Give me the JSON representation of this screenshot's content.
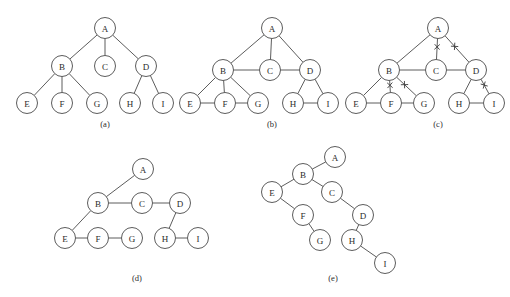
{
  "figure": {
    "title": "",
    "colors": {
      "stroke": "#4a4a4a",
      "node_fill": "#ffffff",
      "label": "#2b2b2b",
      "background": "#ffffff",
      "xmark": "#3a3a3a"
    },
    "node_radius": 10.5,
    "panels": [
      {
        "id": "a",
        "caption": "(a)",
        "caption_pos": {
          "x": 105,
          "y": 127
        },
        "nodes": [
          {
            "label": "A",
            "x": 105,
            "y": 28
          },
          {
            "label": "B",
            "x": 62,
            "y": 66
          },
          {
            "label": "C",
            "x": 105,
            "y": 66
          },
          {
            "label": "D",
            "x": 146,
            "y": 66
          },
          {
            "label": "E",
            "x": 27,
            "y": 103
          },
          {
            "label": "F",
            "x": 62,
            "y": 103
          },
          {
            "label": "G",
            "x": 97,
            "y": 103
          },
          {
            "label": "H",
            "x": 130,
            "y": 103
          },
          {
            "label": "I",
            "x": 163,
            "y": 103
          }
        ],
        "edges": [
          {
            "from": "A",
            "to": "B",
            "marked": false
          },
          {
            "from": "A",
            "to": "C",
            "marked": false
          },
          {
            "from": "A",
            "to": "D",
            "marked": false
          },
          {
            "from": "B",
            "to": "E",
            "marked": false
          },
          {
            "from": "B",
            "to": "F",
            "marked": false
          },
          {
            "from": "B",
            "to": "G",
            "marked": false
          },
          {
            "from": "D",
            "to": "H",
            "marked": false
          },
          {
            "from": "D",
            "to": "I",
            "marked": false
          }
        ]
      },
      {
        "id": "b",
        "caption": "(b)",
        "caption_pos": {
          "x": 272,
          "y": 127
        },
        "nodes": [
          {
            "label": "A",
            "x": 272,
            "y": 28
          },
          {
            "label": "B",
            "x": 223,
            "y": 70
          },
          {
            "label": "C",
            "x": 270,
            "y": 70
          },
          {
            "label": "D",
            "x": 310,
            "y": 70
          },
          {
            "label": "E",
            "x": 190,
            "y": 103
          },
          {
            "label": "F",
            "x": 225,
            "y": 103
          },
          {
            "label": "G",
            "x": 258,
            "y": 103
          },
          {
            "label": "H",
            "x": 293,
            "y": 103
          },
          {
            "label": "I",
            "x": 328,
            "y": 103
          }
        ],
        "edges": [
          {
            "from": "A",
            "to": "B",
            "marked": false
          },
          {
            "from": "A",
            "to": "C",
            "marked": false
          },
          {
            "from": "A",
            "to": "D",
            "marked": false
          },
          {
            "from": "B",
            "to": "C",
            "marked": false
          },
          {
            "from": "C",
            "to": "D",
            "marked": false
          },
          {
            "from": "B",
            "to": "E",
            "marked": false
          },
          {
            "from": "B",
            "to": "F",
            "marked": false
          },
          {
            "from": "B",
            "to": "G",
            "marked": false
          },
          {
            "from": "E",
            "to": "F",
            "marked": false
          },
          {
            "from": "F",
            "to": "G",
            "marked": false
          },
          {
            "from": "D",
            "to": "H",
            "marked": false
          },
          {
            "from": "D",
            "to": "I",
            "marked": false
          },
          {
            "from": "H",
            "to": "I",
            "marked": false
          }
        ]
      },
      {
        "id": "c",
        "caption": "(c)",
        "caption_pos": {
          "x": 438,
          "y": 127
        },
        "nodes": [
          {
            "label": "A",
            "x": 438,
            "y": 28
          },
          {
            "label": "B",
            "x": 389,
            "y": 70
          },
          {
            "label": "C",
            "x": 436,
            "y": 70
          },
          {
            "label": "D",
            "x": 476,
            "y": 70
          },
          {
            "label": "E",
            "x": 356,
            "y": 103
          },
          {
            "label": "F",
            "x": 391,
            "y": 103
          },
          {
            "label": "G",
            "x": 424,
            "y": 103
          },
          {
            "label": "H",
            "x": 459,
            "y": 103
          },
          {
            "label": "I",
            "x": 494,
            "y": 103
          }
        ],
        "edges": [
          {
            "from": "A",
            "to": "B",
            "marked": false
          },
          {
            "from": "A",
            "to": "C",
            "marked": true
          },
          {
            "from": "A",
            "to": "D",
            "marked": true
          },
          {
            "from": "B",
            "to": "C",
            "marked": false
          },
          {
            "from": "C",
            "to": "D",
            "marked": false
          },
          {
            "from": "B",
            "to": "E",
            "marked": false
          },
          {
            "from": "B",
            "to": "F",
            "marked": true
          },
          {
            "from": "B",
            "to": "G",
            "marked": true
          },
          {
            "from": "E",
            "to": "F",
            "marked": false
          },
          {
            "from": "F",
            "to": "G",
            "marked": false
          },
          {
            "from": "D",
            "to": "H",
            "marked": false
          },
          {
            "from": "D",
            "to": "I",
            "marked": true
          },
          {
            "from": "H",
            "to": "I",
            "marked": false
          }
        ]
      },
      {
        "id": "d",
        "caption": "(d)",
        "caption_pos": {
          "x": 137,
          "y": 281
        },
        "nodes": [
          {
            "label": "A",
            "x": 143,
            "y": 169
          },
          {
            "label": "B",
            "x": 98,
            "y": 203
          },
          {
            "label": "C",
            "x": 142,
            "y": 203
          },
          {
            "label": "D",
            "x": 180,
            "y": 203
          },
          {
            "label": "E",
            "x": 65,
            "y": 238
          },
          {
            "label": "F",
            "x": 98,
            "y": 238
          },
          {
            "label": "G",
            "x": 132,
            "y": 238
          },
          {
            "label": "H",
            "x": 165,
            "y": 238
          },
          {
            "label": "I",
            "x": 198,
            "y": 238
          }
        ],
        "edges": [
          {
            "from": "A",
            "to": "B",
            "marked": false
          },
          {
            "from": "B",
            "to": "C",
            "marked": false
          },
          {
            "from": "C",
            "to": "D",
            "marked": false
          },
          {
            "from": "B",
            "to": "E",
            "marked": false
          },
          {
            "from": "E",
            "to": "F",
            "marked": false
          },
          {
            "from": "F",
            "to": "G",
            "marked": false
          },
          {
            "from": "D",
            "to": "H",
            "marked": false
          },
          {
            "from": "H",
            "to": "I",
            "marked": false
          }
        ]
      },
      {
        "id": "e",
        "caption": "(e)",
        "caption_pos": {
          "x": 333,
          "y": 281
        },
        "nodes": [
          {
            "label": "A",
            "x": 335,
            "y": 157
          },
          {
            "label": "B",
            "x": 303,
            "y": 174
          },
          {
            "label": "E",
            "x": 272,
            "y": 192
          },
          {
            "label": "C",
            "x": 332,
            "y": 192
          },
          {
            "label": "F",
            "x": 303,
            "y": 215
          },
          {
            "label": "D",
            "x": 363,
            "y": 215
          },
          {
            "label": "G",
            "x": 320,
            "y": 240
          },
          {
            "label": "H",
            "x": 352,
            "y": 240
          },
          {
            "label": "I",
            "x": 385,
            "y": 263
          }
        ],
        "edges": [
          {
            "from": "A",
            "to": "B",
            "marked": false
          },
          {
            "from": "B",
            "to": "E",
            "marked": false
          },
          {
            "from": "B",
            "to": "C",
            "marked": false
          },
          {
            "from": "E",
            "to": "F",
            "marked": false
          },
          {
            "from": "C",
            "to": "D",
            "marked": false
          },
          {
            "from": "F",
            "to": "G",
            "marked": false
          },
          {
            "from": "D",
            "to": "H",
            "marked": false
          },
          {
            "from": "H",
            "to": "I",
            "marked": false
          }
        ]
      }
    ]
  }
}
